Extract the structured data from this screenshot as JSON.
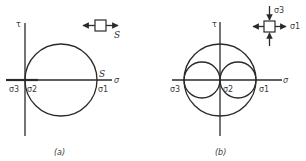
{
  "panels": [
    {
      "id": "a",
      "caption": "(a)",
      "axes": {
        "x_label": "σ",
        "y_label": "τ"
      },
      "point_labels": {
        "sigma3": "σ3",
        "sigma2": "σ2",
        "sigma1": "σ1",
        "S": "S"
      },
      "element": {
        "description": "uniaxial tension element",
        "arrow_label": "S"
      },
      "circles": [
        {
          "name": "mohr-circle",
          "from": "σ2=σ3=0",
          "to": "σ1=S"
        }
      ]
    },
    {
      "id": "b",
      "caption": "(b)",
      "axes": {
        "x_label": "σ",
        "y_label": "τ"
      },
      "point_labels": {
        "sigma3": "σ3",
        "sigma2": "σ2",
        "sigma1": "σ1"
      },
      "element": {
        "description": "biaxial element, tension σ1 horizontal, compression σ3 vertical",
        "label_top": "σ3",
        "label_right": "σ1"
      },
      "circles": [
        {
          "name": "outer-circle",
          "from": "σ3",
          "to": "σ1"
        },
        {
          "name": "left-inner-circle",
          "from": "σ3",
          "to": "σ2"
        },
        {
          "name": "right-inner-circle",
          "from": "σ2",
          "to": "σ1"
        }
      ]
    }
  ]
}
